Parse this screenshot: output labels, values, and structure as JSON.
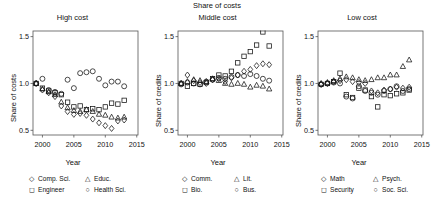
{
  "figure": {
    "suptitle": "Share of costs",
    "xlabel": "Year",
    "xticks": [
      "2000",
      "2005",
      "2010",
      "2015"
    ],
    "yticks": [
      "0.5",
      "1.0",
      "1.5"
    ],
    "xlim": [
      1998.5,
      2015.2
    ],
    "ylim": [
      0.45,
      1.56
    ],
    "xtickvals": [
      2000,
      2005,
      2010,
      2015
    ],
    "ytickvals": [
      0.5,
      1.0,
      1.5
    ],
    "grid": false,
    "legend_position": "below-axes",
    "marker_color": "#111111",
    "frame_color": "#555555"
  },
  "chart_data": [
    {
      "type": "scatter",
      "title": "High cost",
      "xlabel": "Year",
      "ylabel": "Share of costs",
      "xlim": [
        1998.5,
        2015.2
      ],
      "ylim": [
        0.45,
        1.56
      ],
      "series": [
        {
          "name": "Comp. Sci.",
          "marker": "diamond",
          "x": [
            1999,
            2000,
            2001,
            2002,
            2003,
            2004,
            2005,
            2006,
            2007,
            2008,
            2009,
            2010,
            2011,
            2012,
            2013
          ],
          "y": [
            1.0,
            0.93,
            0.9,
            0.86,
            0.76,
            0.7,
            0.67,
            0.68,
            0.66,
            0.62,
            0.58,
            0.55,
            0.52,
            0.6,
            0.61
          ]
        },
        {
          "name": "Educ.",
          "marker": "triangle",
          "x": [
            1999,
            2000,
            2001,
            2002,
            2003,
            2004,
            2005,
            2006,
            2007,
            2008,
            2009,
            2010,
            2011,
            2012,
            2013
          ],
          "y": [
            1.0,
            0.94,
            0.91,
            0.88,
            0.8,
            0.74,
            0.71,
            0.7,
            0.72,
            0.7,
            0.67,
            0.66,
            0.64,
            0.63,
            0.64
          ]
        },
        {
          "name": "Engineer",
          "marker": "square",
          "x": [
            1999,
            2000,
            2001,
            2002,
            2003,
            2004,
            2005,
            2006,
            2007,
            2008,
            2009,
            2010,
            2011,
            2012,
            2013
          ],
          "y": [
            1.0,
            0.95,
            0.92,
            0.9,
            0.88,
            0.8,
            0.75,
            0.76,
            0.72,
            0.73,
            0.72,
            0.75,
            0.79,
            0.78,
            0.82
          ]
        },
        {
          "name": "Health Sci.",
          "marker": "circle",
          "x": [
            1999,
            2000,
            2001,
            2002,
            2003,
            2004,
            2005,
            2006,
            2007,
            2008,
            2009,
            2010,
            2011,
            2012,
            2013
          ],
          "y": [
            1.0,
            1.05,
            0.93,
            0.91,
            0.89,
            1.04,
            0.95,
            1.11,
            1.12,
            1.13,
            1.05,
            0.98,
            1.02,
            1.02,
            0.97
          ]
        }
      ]
    },
    {
      "type": "scatter",
      "title": "Middle cost",
      "xlabel": "Year",
      "ylabel": "Share of credits",
      "xlim": [
        1998.5,
        2015.2
      ],
      "ylim": [
        0.45,
        1.56
      ],
      "series": [
        {
          "name": "Comm.",
          "marker": "diamond",
          "x": [
            1999,
            2000,
            2001,
            2002,
            2003,
            2004,
            2005,
            2006,
            2007,
            2008,
            2009,
            2010,
            2011,
            2012,
            2013
          ],
          "y": [
            1.0,
            1.09,
            1.03,
            1.01,
            1.0,
            1.04,
            1.05,
            1.02,
            1.06,
            1.09,
            1.13,
            1.15,
            1.19,
            1.21,
            1.2
          ]
        },
        {
          "name": "Lit.",
          "marker": "triangle",
          "x": [
            1999,
            2000,
            2001,
            2002,
            2003,
            2004,
            2005,
            2006,
            2007,
            2008,
            2009,
            2010,
            2011,
            2012,
            2013
          ],
          "y": [
            1.0,
            1.02,
            1.04,
            1.03,
            1.02,
            1.05,
            1.03,
            1.0,
            0.99,
            1.0,
            0.99,
            0.96,
            0.98,
            0.97,
            0.94
          ]
        },
        {
          "name": "Bio.",
          "marker": "square",
          "x": [
            1999,
            2000,
            2001,
            2002,
            2003,
            2004,
            2005,
            2006,
            2007,
            2008,
            2009,
            2010,
            2011,
            2012,
            2013
          ],
          "y": [
            1.0,
            0.97,
            1.0,
            0.99,
            1.01,
            1.05,
            1.09,
            1.08,
            1.13,
            1.22,
            1.29,
            1.34,
            1.41,
            1.55,
            1.4
          ]
        },
        {
          "name": "Bus.",
          "marker": "circle",
          "x": [
            1999,
            2000,
            2001,
            2002,
            2003,
            2004,
            2005,
            2006,
            2007,
            2008,
            2009,
            2010,
            2011,
            2012,
            2013
          ],
          "y": [
            0.99,
            1.01,
            1.0,
            0.99,
            1.02,
            1.04,
            1.06,
            1.05,
            1.07,
            1.09,
            1.08,
            1.1,
            1.08,
            1.05,
            1.03
          ]
        }
      ]
    },
    {
      "type": "scatter",
      "title": "Low cost",
      "xlabel": "Year",
      "ylabel": "Share of credits",
      "xlim": [
        1998.5,
        2015.2
      ],
      "ylim": [
        0.45,
        1.56
      ],
      "series": [
        {
          "name": "Math",
          "marker": "diamond",
          "x": [
            1999,
            2000,
            2001,
            2002,
            2003,
            2004,
            2005,
            2006,
            2007,
            2008,
            2009,
            2010,
            2011,
            2012,
            2013
          ],
          "y": [
            0.99,
            1.0,
            1.02,
            1.03,
            1.04,
            1.02,
            1.01,
            1.0,
            0.92,
            0.9,
            0.93,
            0.94,
            0.96,
            0.95,
            0.96
          ]
        },
        {
          "name": "Psych.",
          "marker": "triangle",
          "x": [
            1999,
            2000,
            2001,
            2002,
            2003,
            2004,
            2005,
            2006,
            2007,
            2008,
            2009,
            2010,
            2011,
            2012,
            2013
          ],
          "y": [
            1.0,
            1.01,
            1.03,
            1.05,
            1.07,
            1.06,
            1.04,
            1.03,
            1.04,
            1.06,
            1.06,
            1.09,
            1.09,
            1.18,
            1.25
          ]
        },
        {
          "name": "Security",
          "marker": "square",
          "x": [
            1999,
            2000,
            2001,
            2002,
            2003,
            2004,
            2005,
            2006,
            2007,
            2008,
            2009,
            2010,
            2011,
            2012,
            2013
          ],
          "y": [
            0.99,
            1.0,
            1.02,
            1.11,
            0.88,
            0.85,
            0.95,
            0.93,
            0.86,
            0.75,
            0.88,
            0.87,
            0.89,
            0.9,
            0.93
          ]
        },
        {
          "name": "Soc. Sci.",
          "marker": "circle",
          "x": [
            1999,
            2000,
            2001,
            2002,
            2003,
            2004,
            2005,
            2006,
            2007,
            2008,
            2009,
            2010,
            2011,
            2012,
            2013
          ],
          "y": [
            0.99,
            1.0,
            1.01,
            1.0,
            0.86,
            0.84,
            0.97,
            0.92,
            0.9,
            0.88,
            0.92,
            0.94,
            0.97,
            0.92,
            0.94
          ]
        }
      ]
    }
  ],
  "panels": [
    {
      "title": "High cost",
      "ylabel": "Share of costs",
      "xlabel": "Year",
      "legend": [
        {
          "label": "Comp. Sci.",
          "marker": "diamond"
        },
        {
          "label": "Educ.",
          "marker": "triangle"
        },
        {
          "label": "Engineer",
          "marker": "square"
        },
        {
          "label": "Health Sci.",
          "marker": "circle"
        }
      ]
    },
    {
      "title": "Middle cost",
      "ylabel": "Share of credits",
      "xlabel": "Year",
      "legend": [
        {
          "label": "Comm.",
          "marker": "diamond"
        },
        {
          "label": "Lit.",
          "marker": "triangle"
        },
        {
          "label": "Bio.",
          "marker": "square"
        },
        {
          "label": "Bus.",
          "marker": "circle"
        }
      ]
    },
    {
      "title": "Low cost",
      "ylabel": "Share of credits",
      "xlabel": "Year",
      "legend": [
        {
          "label": "Math",
          "marker": "diamond"
        },
        {
          "label": "Psych.",
          "marker": "triangle"
        },
        {
          "label": "Security",
          "marker": "square"
        },
        {
          "label": "Soc. Sci.",
          "marker": "circle"
        }
      ]
    }
  ]
}
